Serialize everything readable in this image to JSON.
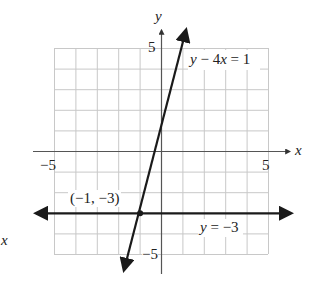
{
  "chart_data": {
    "type": "line",
    "title": "",
    "xlabel": "x",
    "ylabel": "y",
    "xlim": [
      -5,
      5
    ],
    "ylim": [
      -5,
      5
    ],
    "grid": true,
    "x_ticks_labeled": [
      "-5",
      "5"
    ],
    "y_ticks_labeled": [
      "5",
      "-5"
    ],
    "series": [
      {
        "name": "y − 4x = 1",
        "equation": "y = 4x + 1",
        "slope": 4,
        "intercept": 1,
        "points": [
          [
            -1.75,
            -6
          ],
          [
            1.25,
            6
          ]
        ]
      },
      {
        "name": "y = −3",
        "equation": "y = -3",
        "slope": 0,
        "intercept": -3,
        "points": [
          [
            -6,
            -3
          ],
          [
            6,
            -3
          ]
        ]
      }
    ],
    "annotations": [
      {
        "text": "(−1, −3)",
        "x": -1,
        "y": -3,
        "type": "intersection-point"
      }
    ]
  },
  "labels": {
    "y_axis": "y",
    "x_axis": "x",
    "stray_x": "x",
    "tick_y_top": "5",
    "tick_y_bottom": "−5",
    "tick_x_left": "−5",
    "tick_x_right": "5",
    "line1": "y − 4x = 1",
    "line2": "y = −3",
    "point": "(−1, −3)"
  },
  "colors": {
    "grid": "#c8c8c8",
    "axis": "#555555",
    "line": "#1a1a1a"
  }
}
